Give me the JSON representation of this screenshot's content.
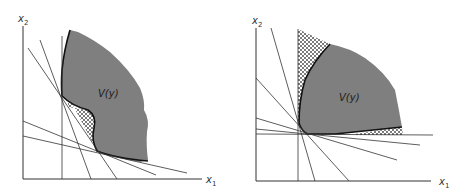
{
  "figure": {
    "colors": {
      "region_fill": "#7f7f7f",
      "line": "#333333",
      "boundary": "#111111",
      "hatch": "#444444",
      "background": "#ffffff"
    },
    "panels": [
      {
        "id": "left",
        "x_axis_label": "x",
        "x_axis_sub": "1",
        "y_axis_label": "x",
        "y_axis_sub": "2",
        "region_label": "V(y)"
      },
      {
        "id": "right",
        "x_axis_label": "x",
        "x_axis_sub": "1",
        "y_axis_label": "x",
        "y_axis_sub": "2",
        "region_label": "V(y)"
      }
    ]
  }
}
